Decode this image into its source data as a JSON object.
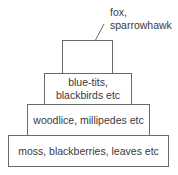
{
  "diagram": {
    "type": "pyramid of numbers",
    "levels": [
      {
        "level": 4,
        "label_line1": "fox,",
        "label_line2": "sparrowhawk",
        "label_position": "external"
      },
      {
        "level": 3,
        "label_line1": "blue-tits,",
        "label_line2": "blackbirds etc"
      },
      {
        "level": 2,
        "label": "woodlice, millipedes etc"
      },
      {
        "level": 1,
        "label": "moss, blackberries, leaves etc"
      }
    ],
    "colors": {
      "border": "#6a6a6a",
      "text": "#3a3a3a",
      "background": "#ffffff"
    }
  }
}
